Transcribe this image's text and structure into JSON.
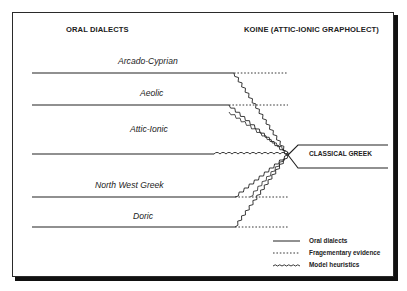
{
  "headers": {
    "left": "ORAL DIALECTS",
    "right": "KOINE (ATTIC-IONIC GRAPHOLECT)"
  },
  "dialects": [
    {
      "label": "Arcado-Cyprian",
      "y": 73,
      "solid_end": 234,
      "label_x": 118,
      "label_y": 56
    },
    {
      "label": "Aeolic",
      "y": 105,
      "solid_end": 229,
      "label_x": 140,
      "label_y": 88
    },
    {
      "label": "Attic-Ionic",
      "y": 154,
      "solid_end": 214,
      "label_x": 130,
      "label_y": 124
    },
    {
      "label": "North West Greek",
      "y": 197,
      "solid_end": 235,
      "label_x": 95,
      "label_y": 180
    },
    {
      "label": "Doric",
      "y": 227,
      "solid_end": 235,
      "label_x": 133,
      "label_y": 211
    }
  ],
  "convergence": {
    "x": 288,
    "y": 155
  },
  "result": {
    "label": "CLASSICAL GREEK",
    "box_top": 145,
    "box_bottom": 168,
    "box_left": 298,
    "box_right": 388
  },
  "legend": [
    {
      "style": "solid",
      "label": "Oral dialects"
    },
    {
      "style": "dotted",
      "label": "Fragementary evidence"
    },
    {
      "style": "wavy",
      "label": "Model heuristics"
    }
  ],
  "colors": {
    "ink": "#222222",
    "frame": "#2a2a2a",
    "shadow": "#111111",
    "background": "#ffffff"
  }
}
